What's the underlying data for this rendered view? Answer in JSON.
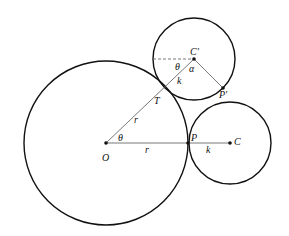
{
  "diagram": {
    "type": "geometry",
    "colors": {
      "stroke": "#111111",
      "thin": "#555555",
      "background": "#ffffff"
    },
    "labels": {
      "O": "O",
      "P": "P",
      "C": "C",
      "C_prime": "C′",
      "P_prime": "P′",
      "T": "T",
      "r_horizontal": "r",
      "r_slant": "r",
      "k_horizontal": "k",
      "k_slant": "k",
      "theta_at_O": "θ",
      "theta_at_Cprime": "θ",
      "alpha": "α"
    },
    "circles": [
      {
        "name": "large-circle",
        "center": "O",
        "radius": "r"
      },
      {
        "name": "small-circle-initial",
        "center": "C",
        "radius": "k"
      },
      {
        "name": "small-circle-rolled",
        "center": "C′",
        "radius": "k"
      }
    ],
    "segments": [
      "O–P (r)",
      "P–C (k)",
      "O–T (r)",
      "T–C′ (k)",
      "C′–P′",
      "horizontal dashed from C′"
    ]
  }
}
